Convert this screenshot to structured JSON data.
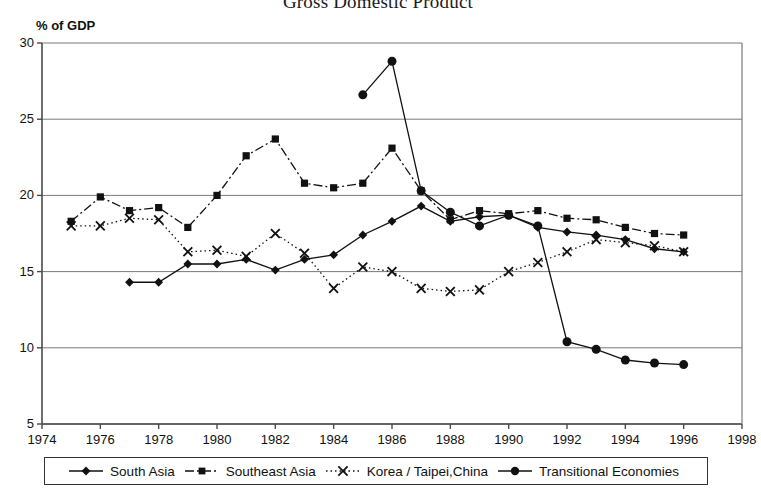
{
  "chart_data": {
    "type": "line",
    "title": "Gross Domestic Product",
    "ylabel": "% of GDP",
    "xlabel": "",
    "xlim": [
      1974,
      1998
    ],
    "ylim": [
      5,
      30
    ],
    "grid": true,
    "legend_position": "bottom",
    "x_ticks": [
      1974,
      1976,
      1978,
      1980,
      1982,
      1984,
      1986,
      1988,
      1990,
      1992,
      1994,
      1996,
      1998
    ],
    "y_ticks": [
      5,
      10,
      15,
      20,
      25,
      30
    ],
    "series": [
      {
        "name": "South Asia",
        "marker": "diamond",
        "line_style": "solid",
        "color": "#111111",
        "x": [
          1977,
          1978,
          1979,
          1980,
          1981,
          1982,
          1983,
          1984,
          1985,
          1986,
          1987,
          1988,
          1989,
          1990,
          1991,
          1992,
          1993,
          1994,
          1995,
          1996
        ],
        "values": [
          14.3,
          14.3,
          15.5,
          15.5,
          15.8,
          15.1,
          15.8,
          16.1,
          17.4,
          18.3,
          19.3,
          18.3,
          18.6,
          18.7,
          17.9,
          17.6,
          17.4,
          17.1,
          16.5,
          16.3
        ]
      },
      {
        "name": "Southeast Asia",
        "marker": "square",
        "line_style": "dashdot",
        "color": "#111111",
        "x": [
          1975,
          1976,
          1977,
          1978,
          1979,
          1980,
          1981,
          1982,
          1983,
          1984,
          1985,
          1986,
          1987,
          1988,
          1989,
          1990,
          1991,
          1992,
          1993,
          1994,
          1995,
          1996
        ],
        "values": [
          18.3,
          19.9,
          19.0,
          19.2,
          17.9,
          20.0,
          22.6,
          23.7,
          20.8,
          20.5,
          20.8,
          23.1,
          20.3,
          18.4,
          19.0,
          18.8,
          19.0,
          18.5,
          18.4,
          17.9,
          17.5,
          17.4
        ]
      },
      {
        "name": "Korea / Taipei,China",
        "marker": "x",
        "line_style": "dotted",
        "color": "#111111",
        "x": [
          1975,
          1976,
          1977,
          1978,
          1979,
          1980,
          1981,
          1982,
          1983,
          1984,
          1985,
          1986,
          1987,
          1988,
          1989,
          1990,
          1991,
          1992,
          1993,
          1994,
          1995,
          1996
        ],
        "values": [
          18.0,
          18.0,
          18.5,
          18.4,
          16.3,
          16.4,
          16.0,
          17.5,
          16.2,
          13.9,
          15.3,
          15.0,
          13.9,
          13.7,
          13.8,
          15.0,
          15.6,
          16.3,
          17.1,
          16.9,
          16.7,
          16.3
        ]
      },
      {
        "name": "Transitional Economies",
        "marker": "circle",
        "line_style": "solid",
        "color": "#111111",
        "x": [
          1985,
          1986,
          1987,
          1988,
          1989,
          1990,
          1991,
          1992,
          1993,
          1994,
          1995,
          1996
        ],
        "values": [
          26.6,
          28.8,
          20.3,
          18.9,
          18.0,
          18.7,
          18.0,
          10.4,
          9.9,
          9.2,
          9.0,
          8.9
        ]
      }
    ]
  }
}
